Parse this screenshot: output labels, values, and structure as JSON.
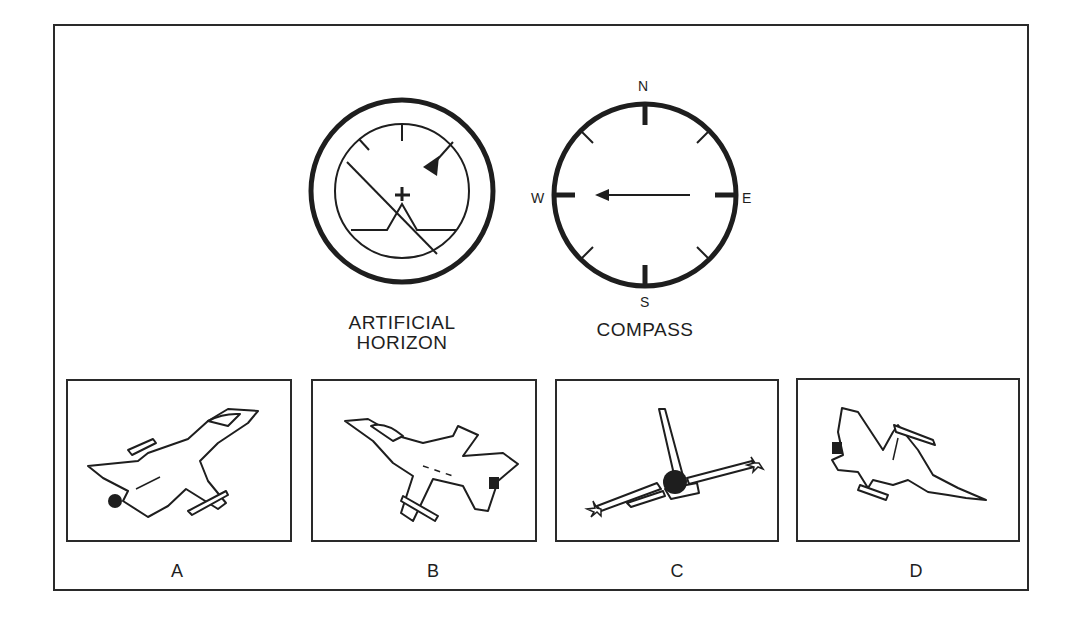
{
  "instruments": {
    "artificial_horizon": {
      "label": "ARTIFICIAL\nHORIZON",
      "bank": "left wing down (horizon tilted, lower-left to... line slanted)",
      "pitch": "nose up"
    },
    "compass": {
      "label": "COMPASS",
      "cardinals": {
        "n": "N",
        "e": "E",
        "s": "S",
        "w": "W"
      },
      "heading": "W"
    }
  },
  "options": [
    {
      "id": "a",
      "label": "A"
    },
    {
      "id": "b",
      "label": "B"
    },
    {
      "id": "c",
      "label": "C"
    },
    {
      "id": "d",
      "label": "D"
    }
  ],
  "colors": {
    "ink": "#1e1e1e",
    "background": "#ffffff"
  }
}
